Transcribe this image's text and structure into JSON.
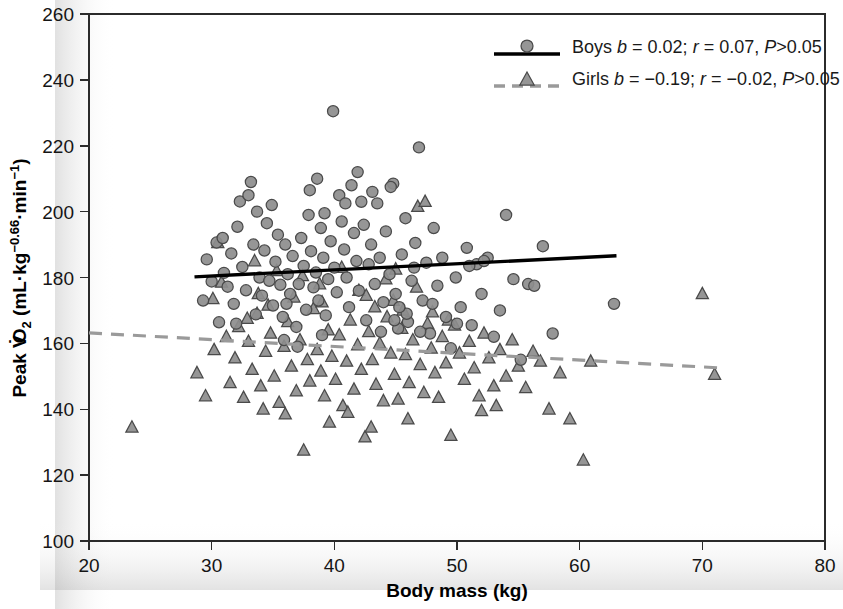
{
  "chart_data": {
    "type": "scatter",
    "title": "",
    "xlabel": "Body mass (kg)",
    "ylabel": "Peak VO2 (mL·kg−0.66·min−1)",
    "ylabel_parts": {
      "prefix": "Peak V",
      "v_dot": "̇",
      "o": "O",
      "sub2": "2",
      "unit_open": " (mL",
      "dot1": "·",
      "kg": "kg",
      "exp1": "−0.66",
      "dot2": "·",
      "min": "min",
      "exp2": "−1",
      "unit_close": ")"
    },
    "xlim": [
      20,
      80
    ],
    "ylim": [
      100,
      260
    ],
    "xticks": [
      20,
      30,
      40,
      50,
      60,
      70,
      80
    ],
    "yticks": [
      100,
      120,
      140,
      160,
      180,
      200,
      220,
      240,
      260
    ],
    "grid": false,
    "legend_position": "top-right",
    "series": [
      {
        "name": "Boys",
        "marker": "circle",
        "color": "#8d8d8d",
        "edge_color": "#4a4a4a",
        "legend_label": "Boys b = 0.02; r = 0.07, P>0.05",
        "stats": {
          "b": "0.02",
          "r": "0.07",
          "p": "P>0.05"
        },
        "fit": {
          "style": "solid",
          "color": "#000000",
          "x0": 28.6,
          "y0": 180.2,
          "x1": 63.0,
          "y1": 186.6
        },
        "points": [
          [
            29.3,
            173.0
          ],
          [
            29.6,
            185.5
          ],
          [
            30.0,
            178.8
          ],
          [
            30.4,
            190.6
          ],
          [
            30.6,
            166.4
          ],
          [
            31.0,
            181.4
          ],
          [
            31.3,
            177.2
          ],
          [
            31.6,
            187.3
          ],
          [
            31.8,
            172.0
          ],
          [
            32.1,
            195.4
          ],
          [
            32.3,
            203.1
          ],
          [
            32.5,
            183.2
          ],
          [
            32.8,
            176.1
          ],
          [
            33.0,
            205.0
          ],
          [
            33.2,
            209.0
          ],
          [
            33.4,
            190.0
          ],
          [
            33.6,
            168.8
          ],
          [
            33.9,
            180.0
          ],
          [
            34.1,
            174.5
          ],
          [
            34.3,
            188.2
          ],
          [
            34.5,
            196.5
          ],
          [
            34.7,
            179.0
          ],
          [
            35.0,
            171.5
          ],
          [
            35.2,
            184.8
          ],
          [
            35.4,
            193.0
          ],
          [
            35.6,
            177.8
          ],
          [
            35.8,
            168.0
          ],
          [
            36.0,
            190.0
          ],
          [
            36.2,
            181.0
          ],
          [
            36.4,
            175.0
          ],
          [
            36.6,
            186.5
          ],
          [
            36.9,
            165.0
          ],
          [
            37.1,
            178.0
          ],
          [
            37.3,
            192.0
          ],
          [
            37.5,
            183.5
          ],
          [
            37.7,
            170.2
          ],
          [
            37.9,
            199.0
          ],
          [
            38.1,
            188.0
          ],
          [
            38.3,
            177.0
          ],
          [
            38.5,
            181.5
          ],
          [
            38.7,
            173.0
          ],
          [
            38.9,
            195.0
          ],
          [
            39.1,
            186.0
          ],
          [
            39.3,
            168.5
          ],
          [
            39.5,
            179.5
          ],
          [
            39.7,
            191.0
          ],
          [
            39.9,
            230.5
          ],
          [
            40.0,
            183.0
          ],
          [
            40.2,
            175.5
          ],
          [
            40.4,
            205.0
          ],
          [
            40.6,
            197.0
          ],
          [
            40.8,
            188.5
          ],
          [
            41.0,
            180.0
          ],
          [
            41.2,
            171.0
          ],
          [
            41.4,
            208.0
          ],
          [
            41.6,
            193.5
          ],
          [
            41.8,
            185.0
          ],
          [
            42.0,
            176.0
          ],
          [
            42.2,
            203.0
          ],
          [
            42.4,
            196.0
          ],
          [
            42.6,
            167.0
          ],
          [
            42.8,
            184.0
          ],
          [
            43.0,
            190.0
          ],
          [
            43.3,
            178.0
          ],
          [
            43.5,
            202.5
          ],
          [
            43.7,
            186.0
          ],
          [
            44.0,
            172.5
          ],
          [
            44.2,
            194.0
          ],
          [
            44.5,
            181.0
          ],
          [
            44.8,
            208.5
          ],
          [
            45.0,
            175.0
          ],
          [
            45.2,
            164.5
          ],
          [
            45.5,
            187.0
          ],
          [
            45.8,
            198.0
          ],
          [
            46.0,
            166.5
          ],
          [
            46.3,
            179.0
          ],
          [
            46.6,
            190.5
          ],
          [
            46.9,
            219.5
          ],
          [
            47.2,
            173.0
          ],
          [
            47.5,
            184.5
          ],
          [
            47.8,
            163.0
          ],
          [
            48.1,
            195.0
          ],
          [
            48.4,
            177.5
          ],
          [
            48.8,
            186.0
          ],
          [
            49.1,
            168.0
          ],
          [
            49.5,
            158.5
          ],
          [
            49.9,
            180.0
          ],
          [
            50.3,
            171.0
          ],
          [
            50.8,
            189.0
          ],
          [
            51.2,
            165.5
          ],
          [
            51.6,
            184.0
          ],
          [
            52.0,
            175.0
          ],
          [
            52.5,
            186.0
          ],
          [
            53.0,
            162.0
          ],
          [
            53.5,
            170.0
          ],
          [
            54.0,
            199.0
          ],
          [
            54.6,
            179.5
          ],
          [
            55.2,
            155.0
          ],
          [
            55.8,
            178.0
          ],
          [
            56.3,
            177.5
          ],
          [
            57.0,
            189.5
          ],
          [
            57.8,
            163.0
          ],
          [
            62.8,
            172.0
          ],
          [
            33.7,
            200.0
          ],
          [
            34.9,
            202.0
          ],
          [
            36.1,
            172.0
          ],
          [
            38.0,
            206.5
          ],
          [
            38.6,
            210.0
          ],
          [
            39.2,
            199.5
          ],
          [
            40.9,
            202.5
          ],
          [
            41.9,
            212.0
          ],
          [
            43.1,
            206.0
          ],
          [
            44.6,
            207.5
          ],
          [
            30.9,
            192.0
          ],
          [
            32.0,
            166.0
          ],
          [
            35.9,
            161.0
          ],
          [
            37.0,
            159.0
          ],
          [
            39.0,
            162.5
          ],
          [
            44.9,
            167.0
          ],
          [
            45.9,
            169.0
          ],
          [
            47.0,
            163.5
          ],
          [
            48.0,
            172.0
          ],
          [
            50.0,
            166.0
          ],
          [
            51.0,
            183.5
          ],
          [
            52.2,
            185.0
          ],
          [
            46.5,
            183.0
          ],
          [
            45.3,
            171.0
          ],
          [
            43.8,
            163.5
          ]
        ]
      },
      {
        "name": "Girls",
        "marker": "triangle",
        "color": "#8d8d8d",
        "edge_color": "#4a4a4a",
        "legend_label": "Girls b = −0.19; r = −0.02, P>0.05",
        "stats": {
          "b": "−0.19",
          "r": "−0.02",
          "p": "P>0.05"
        },
        "fit": {
          "style": "dashed",
          "color": "#9a9a9a",
          "x0": 20.0,
          "y0": 163.2,
          "x1": 71.2,
          "y1": 152.6
        },
        "points": [
          [
            23.5,
            134.5
          ],
          [
            28.8,
            151.0
          ],
          [
            29.5,
            144.0
          ],
          [
            30.2,
            158.0
          ],
          [
            30.5,
            190.5
          ],
          [
            30.8,
            178.5
          ],
          [
            31.2,
            162.0
          ],
          [
            31.5,
            148.0
          ],
          [
            31.9,
            155.5
          ],
          [
            32.2,
            165.0
          ],
          [
            32.6,
            143.5
          ],
          [
            33.0,
            160.5
          ],
          [
            33.3,
            152.0
          ],
          [
            33.7,
            169.0
          ],
          [
            34.0,
            147.0
          ],
          [
            34.4,
            157.5
          ],
          [
            34.8,
            163.0
          ],
          [
            35.1,
            150.0
          ],
          [
            35.5,
            142.0
          ],
          [
            35.9,
            159.0
          ],
          [
            36.2,
            166.5
          ],
          [
            36.5,
            153.0
          ],
          [
            36.9,
            145.5
          ],
          [
            37.2,
            161.0
          ],
          [
            37.5,
            127.5
          ],
          [
            37.8,
            155.0
          ],
          [
            38.0,
            148.5
          ],
          [
            38.3,
            170.5
          ],
          [
            38.6,
            158.0
          ],
          [
            38.9,
            151.5
          ],
          [
            39.2,
            144.0
          ],
          [
            39.5,
            164.0
          ],
          [
            39.8,
            156.0
          ],
          [
            40.1,
            149.0
          ],
          [
            40.4,
            162.5
          ],
          [
            40.7,
            141.0
          ],
          [
            41.0,
            154.5
          ],
          [
            41.3,
            167.0
          ],
          [
            41.6,
            146.0
          ],
          [
            41.9,
            159.5
          ],
          [
            42.2,
            152.0
          ],
          [
            42.5,
            131.5
          ],
          [
            42.8,
            163.5
          ],
          [
            43.1,
            155.0
          ],
          [
            43.4,
            147.5
          ],
          [
            43.7,
            160.0
          ],
          [
            44.0,
            142.5
          ],
          [
            44.3,
            168.0
          ],
          [
            44.6,
            157.0
          ],
          [
            44.9,
            150.5
          ],
          [
            45.2,
            143.0
          ],
          [
            45.5,
            164.5
          ],
          [
            45.8,
            156.5
          ],
          [
            46.1,
            148.0
          ],
          [
            46.4,
            161.0
          ],
          [
            46.7,
            177.0
          ],
          [
            47.0,
            153.5
          ],
          [
            47.3,
            145.0
          ],
          [
            47.6,
            166.0
          ],
          [
            47.9,
            158.5
          ],
          [
            48.2,
            151.0
          ],
          [
            48.5,
            143.5
          ],
          [
            48.8,
            162.0
          ],
          [
            49.1,
            154.0
          ],
          [
            49.5,
            132.0
          ],
          [
            49.8,
            165.5
          ],
          [
            50.2,
            157.0
          ],
          [
            50.6,
            149.0
          ],
          [
            51.0,
            160.5
          ],
          [
            51.4,
            152.5
          ],
          [
            51.8,
            144.0
          ],
          [
            52.2,
            163.0
          ],
          [
            52.6,
            155.5
          ],
          [
            53.0,
            147.0
          ],
          [
            53.5,
            158.0
          ],
          [
            54.0,
            150.0
          ],
          [
            54.5,
            161.0
          ],
          [
            55.0,
            153.0
          ],
          [
            55.6,
            146.5
          ],
          [
            56.2,
            157.5
          ],
          [
            56.8,
            154.5
          ],
          [
            57.5,
            140.0
          ],
          [
            58.4,
            151.0
          ],
          [
            59.2,
            137.0
          ],
          [
            60.3,
            124.5
          ],
          [
            60.9,
            154.5
          ],
          [
            70.0,
            175.0
          ],
          [
            71.0,
            150.5
          ],
          [
            33.5,
            185.0
          ],
          [
            35.3,
            182.0
          ],
          [
            37.4,
            180.5
          ],
          [
            38.8,
            178.0
          ],
          [
            40.6,
            183.0
          ],
          [
            42.0,
            176.0
          ],
          [
            44.2,
            179.5
          ],
          [
            45.0,
            182.5
          ],
          [
            46.8,
            201.5
          ],
          [
            47.4,
            203.0
          ],
          [
            33.8,
            175.0
          ],
          [
            34.6,
            171.5
          ],
          [
            36.7,
            174.0
          ],
          [
            39.0,
            172.5
          ],
          [
            42.6,
            174.5
          ],
          [
            43.3,
            171.0
          ],
          [
            44.8,
            173.0
          ],
          [
            45.6,
            170.0
          ],
          [
            48.0,
            169.5
          ],
          [
            49.3,
            167.0
          ],
          [
            30.1,
            173.5
          ],
          [
            32.9,
            167.5
          ],
          [
            34.2,
            140.0
          ],
          [
            36.0,
            138.5
          ],
          [
            39.6,
            136.0
          ],
          [
            41.1,
            139.0
          ],
          [
            43.0,
            134.5
          ],
          [
            46.0,
            137.0
          ],
          [
            52.0,
            139.5
          ],
          [
            53.2,
            141.0
          ]
        ]
      }
    ]
  },
  "legend": {
    "boys_prefix": "Boys ",
    "girls_prefix": "Girls ",
    "b_sym": "b",
    "r_sym": "r",
    "p_sym": "P",
    "eq": " = ",
    "semi": "; ",
    "comma": ", ",
    "gt": ">0.05",
    "boys_b": "0.02",
    "boys_r": "0.07",
    "girls_b": "−0.19",
    "girls_r": "−0.02"
  }
}
